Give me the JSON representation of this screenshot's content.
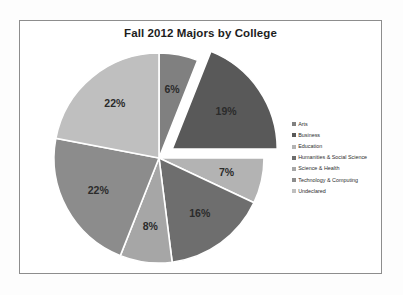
{
  "chart_data": {
    "type": "pie",
    "title": "Fall 2012 Majors by College",
    "categories": [
      "Arts",
      "Business",
      "Education",
      "Humanities & Social Science",
      "Science & Health",
      "Technology & Computing",
      "Undeclared"
    ],
    "values": [
      6,
      19,
      7,
      16,
      8,
      22,
      22
    ],
    "value_labels": [
      "6%",
      "19%",
      "7%",
      "16%",
      "8%",
      "22%",
      "22%"
    ],
    "units": "percent",
    "colors": [
      "#808080",
      "#595959",
      "#b3b3b3",
      "#6e6e6e",
      "#a6a6a6",
      "#8c8c8c",
      "#bfbfbf"
    ],
    "exploded_slice": "Business",
    "legend_position": "right",
    "grid": false,
    "xlabel": "",
    "ylabel": "",
    "slices": [
      {
        "label": "Arts",
        "value": 6,
        "display": "6%",
        "color": "#808080",
        "exploded": false
      },
      {
        "label": "Business",
        "value": 19,
        "display": "19%",
        "color": "#595959",
        "exploded": true
      },
      {
        "label": "Education",
        "value": 7,
        "display": "7%",
        "color": "#b3b3b3",
        "exploded": false
      },
      {
        "label": "Humanities & Social Science",
        "value": 16,
        "display": "16%",
        "color": "#6e6e6e",
        "exploded": false
      },
      {
        "label": "Science & Health",
        "value": 8,
        "display": "8%",
        "color": "#a6a6a6",
        "exploded": false
      },
      {
        "label": "Technology & Computing",
        "value": 22,
        "display": "22%",
        "color": "#8c8c8c",
        "exploded": false
      },
      {
        "label": "Undeclared",
        "value": 22,
        "display": "22%",
        "color": "#bfbfbf",
        "exploded": false
      }
    ]
  },
  "legend": {
    "items": [
      {
        "label": "Arts",
        "color": "#808080"
      },
      {
        "label": "Business",
        "color": "#595959"
      },
      {
        "label": "Education",
        "color": "#b3b3b3"
      },
      {
        "label": "Humanities & Social Science",
        "color": "#6e6e6e"
      },
      {
        "label": "Science & Health",
        "color": "#a6a6a6"
      },
      {
        "label": "Technology & Computing",
        "color": "#8c8c8c"
      },
      {
        "label": "Undeclared",
        "color": "#bfbfbf"
      }
    ]
  },
  "frame": {
    "border_color": "#8d8d8d",
    "background": "#ffffff"
  }
}
